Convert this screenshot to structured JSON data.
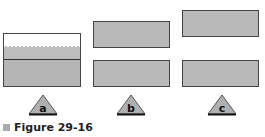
{
  "panels": [
    {
      "label": "a",
      "description": "block floating in liquid-filled container"
    },
    {
      "label": "b",
      "description": "two blocks, upper block lower position"
    },
    {
      "label": "c",
      "description": "two blocks, upper block higher position"
    }
  ],
  "caption": "Figure 29-16",
  "colors": {
    "block_fill": "#b9b9b9",
    "outline": "#444444",
    "liquid": "#bdbdbd"
  }
}
